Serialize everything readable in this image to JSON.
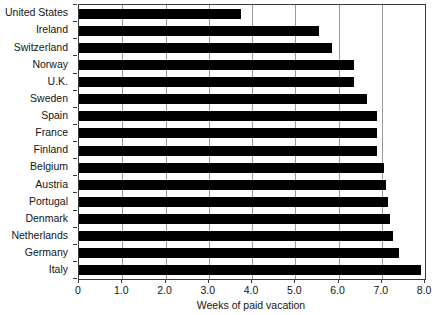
{
  "chart_data": {
    "type": "bar",
    "orientation": "horizontal",
    "title": "",
    "xlabel": "Weeks of paid vacation",
    "ylabel": "",
    "xlim": [
      0,
      8
    ],
    "xticks": [
      0,
      1,
      2,
      3,
      4,
      5,
      6,
      7,
      8
    ],
    "xtick_labels": [
      "0",
      "1.0",
      "2.0",
      "3.0",
      "4.0",
      "5.0",
      "6.0",
      "7.0",
      "8.0"
    ],
    "grid": "vertical",
    "legend": "none",
    "bar_color": "#000000",
    "categories": [
      "United States",
      "Ireland",
      "Switzerland",
      "Norway",
      "U.K.",
      "Sweden",
      "Spain",
      "France",
      "Finland",
      "Belgium",
      "Austria",
      "Portugal",
      "Denmark",
      "Netherlands",
      "Germany",
      "Italy"
    ],
    "values": [
      3.75,
      5.55,
      5.85,
      6.35,
      6.35,
      6.65,
      6.9,
      6.9,
      6.9,
      7.05,
      7.1,
      7.15,
      7.2,
      7.25,
      7.4,
      7.9
    ]
  }
}
